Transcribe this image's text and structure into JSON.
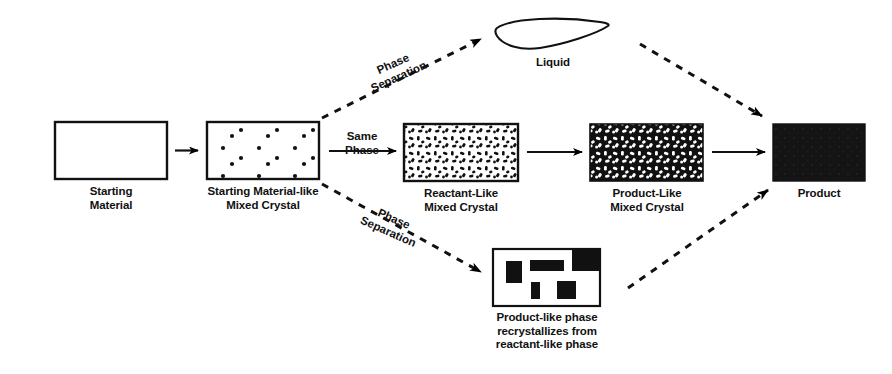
{
  "figure": {
    "background_color": "#ffffff",
    "ink_color": "#000000"
  },
  "nodes": [
    {
      "id": "starting-material",
      "label": "Starting\nMaterial",
      "shape": "rectangle",
      "fill": "empty",
      "x": 55,
      "y": 122,
      "w": 112,
      "h": 57
    },
    {
      "id": "starting-material-like-mixed-crystal",
      "label": "Starting Material-like\nMixed Crystal",
      "shape": "rectangle",
      "fill": "sparse-dots",
      "x": 207,
      "y": 122,
      "w": 112,
      "h": 57
    },
    {
      "id": "reactant-like-mixed-crystal",
      "label": "Reactant-Like\nMixed Crystal",
      "shape": "rectangle",
      "fill": "dense-dots",
      "x": 404,
      "y": 124,
      "w": 114,
      "h": 57
    },
    {
      "id": "product-like-mixed-crystal",
      "label": "Product-Like\nMixed Crystal",
      "shape": "rectangle",
      "fill": "inverted-dots",
      "x": 590,
      "y": 124,
      "w": 113,
      "h": 57
    },
    {
      "id": "product",
      "label": "Product",
      "shape": "rectangle",
      "fill": "solid-black",
      "x": 773,
      "y": 124,
      "w": 92,
      "h": 57
    },
    {
      "id": "liquid",
      "label": "Liquid",
      "shape": "lens",
      "fill": "empty",
      "x": 493,
      "y": 20,
      "w": 118,
      "h": 30
    },
    {
      "id": "product-like-phase",
      "label": "Product-like phase\nrecrystallizes from\nreactant-like phase",
      "shape": "rectangle",
      "fill": "black-blocks",
      "x": 493,
      "y": 249,
      "w": 107,
      "h": 57
    }
  ],
  "edges": [
    {
      "id": "sm-to-smmc",
      "style": "solid",
      "label": ""
    },
    {
      "id": "smmc-to-rlmc",
      "style": "solid",
      "label": "Same\nPhase"
    },
    {
      "id": "rlmc-to-plmc",
      "style": "solid",
      "label": ""
    },
    {
      "id": "plmc-to-product",
      "style": "solid",
      "label": ""
    },
    {
      "id": "smmc-to-liquid",
      "style": "dashed",
      "label": "Phase\nSeparation"
    },
    {
      "id": "liquid-to-product",
      "style": "dashed",
      "label": ""
    },
    {
      "id": "smmc-to-plphase",
      "style": "dashed",
      "label": "Phase\nSeparation"
    },
    {
      "id": "plphase-to-product",
      "style": "dashed",
      "label": ""
    }
  ],
  "labels": {
    "starting_material": "Starting\nMaterial",
    "starting_material_like": "Starting Material-like\nMixed Crystal",
    "reactant_like": "Reactant-Like\nMixed Crystal",
    "product_like": "Product-Like\nMixed Crystal",
    "product": "Product",
    "liquid": "Liquid",
    "product_like_phase": "Product-like phase\nrecrystallizes from\nreactant-like phase",
    "same_phase": "Same\nPhase",
    "phase_separation_top": "Phase\nSeparation",
    "phase_separation_bottom": "Phase\nSeparation"
  }
}
